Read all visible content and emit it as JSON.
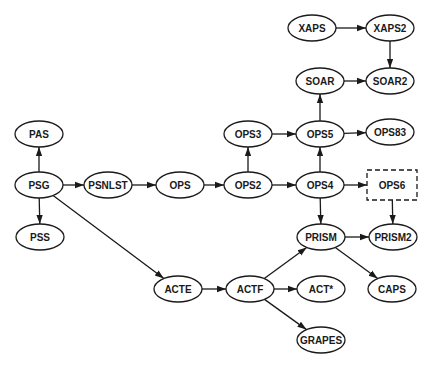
{
  "diagram": {
    "type": "directed-graph",
    "colors": {
      "stroke": "#1a1a1a",
      "background": "#ffffff",
      "text": "#1a1a1a"
    },
    "nodes": [
      {
        "id": "XAPS",
        "label": "XAPS",
        "x": 312,
        "y": 28,
        "shape": "ellipse"
      },
      {
        "id": "XAPS2",
        "label": "XAPS2",
        "x": 390,
        "y": 28,
        "shape": "ellipse"
      },
      {
        "id": "SOAR",
        "label": "SOAR",
        "x": 320,
        "y": 81,
        "shape": "ellipse"
      },
      {
        "id": "SOAR2",
        "label": "SOAR2",
        "x": 390,
        "y": 81,
        "shape": "ellipse"
      },
      {
        "id": "PAS",
        "label": "PAS",
        "x": 39,
        "y": 134,
        "shape": "ellipse"
      },
      {
        "id": "OPS3",
        "label": "OPS3",
        "x": 248,
        "y": 134,
        "shape": "ellipse"
      },
      {
        "id": "OPS5",
        "label": "OPS5",
        "x": 320,
        "y": 134,
        "shape": "ellipse"
      },
      {
        "id": "OPS83",
        "label": "OPS83",
        "x": 390,
        "y": 132,
        "shape": "ellipse"
      },
      {
        "id": "PSG",
        "label": "PSG",
        "x": 39,
        "y": 185,
        "shape": "ellipse"
      },
      {
        "id": "PSNLST",
        "label": "PSNLST",
        "x": 108,
        "y": 185,
        "shape": "ellipse"
      },
      {
        "id": "OPS",
        "label": "OPS",
        "x": 180,
        "y": 185,
        "shape": "ellipse"
      },
      {
        "id": "OPS2",
        "label": "OPS2",
        "x": 248,
        "y": 185,
        "shape": "ellipse"
      },
      {
        "id": "OPS4",
        "label": "OPS4",
        "x": 320,
        "y": 185,
        "shape": "ellipse"
      },
      {
        "id": "OPS6",
        "label": "OPS6",
        "x": 392,
        "y": 185,
        "shape": "dashed-rect"
      },
      {
        "id": "PSS",
        "label": "PSS",
        "x": 40,
        "y": 237,
        "shape": "ellipse"
      },
      {
        "id": "PRISM",
        "label": "PRISM",
        "x": 321,
        "y": 237,
        "shape": "ellipse"
      },
      {
        "id": "PRISM2",
        "label": "PRISM2",
        "x": 393,
        "y": 237,
        "shape": "ellipse"
      },
      {
        "id": "ACTE",
        "label": "ACTE",
        "x": 178,
        "y": 289,
        "shape": "ellipse"
      },
      {
        "id": "ACTF",
        "label": "ACTF",
        "x": 250,
        "y": 289,
        "shape": "ellipse"
      },
      {
        "id": "ACTSTAR",
        "label": "ACT*",
        "x": 321,
        "y": 289,
        "shape": "ellipse"
      },
      {
        "id": "CAPS",
        "label": "CAPS",
        "x": 392,
        "y": 289,
        "shape": "ellipse"
      },
      {
        "id": "GRAPES",
        "label": "GRAPES",
        "x": 321,
        "y": 340,
        "shape": "ellipse"
      }
    ],
    "edges": [
      {
        "from": "XAPS",
        "to": "XAPS2"
      },
      {
        "from": "XAPS2",
        "to": "SOAR2"
      },
      {
        "from": "SOAR",
        "to": "SOAR2"
      },
      {
        "from": "OPS5",
        "to": "SOAR"
      },
      {
        "from": "OPS3",
        "to": "OPS5"
      },
      {
        "from": "OPS5",
        "to": "OPS83"
      },
      {
        "from": "PSG",
        "to": "PAS"
      },
      {
        "from": "PSG",
        "to": "PSNLST"
      },
      {
        "from": "PSNLST",
        "to": "OPS"
      },
      {
        "from": "OPS",
        "to": "OPS2"
      },
      {
        "from": "OPS2",
        "to": "OPS3"
      },
      {
        "from": "OPS2",
        "to": "OPS4"
      },
      {
        "from": "OPS4",
        "to": "OPS5"
      },
      {
        "from": "OPS4",
        "to": "OPS6"
      },
      {
        "from": "OPS4",
        "to": "PRISM"
      },
      {
        "from": "OPS6",
        "to": "PRISM2"
      },
      {
        "from": "PRISM",
        "to": "PRISM2"
      },
      {
        "from": "PRISM",
        "to": "CAPS"
      },
      {
        "from": "PSG",
        "to": "PSS"
      },
      {
        "from": "PSG",
        "to": "ACTE"
      },
      {
        "from": "ACTE",
        "to": "ACTF"
      },
      {
        "from": "ACTF",
        "to": "PRISM"
      },
      {
        "from": "ACTF",
        "to": "ACTSTAR"
      },
      {
        "from": "ACTF",
        "to": "GRAPES"
      }
    ]
  }
}
